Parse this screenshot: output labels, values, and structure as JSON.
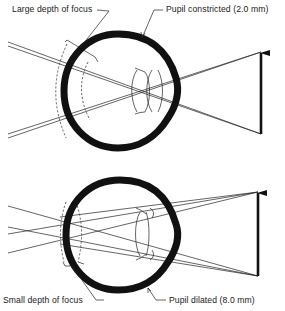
{
  "figure": {
    "top_panel": {
      "depth_label": "Large depth of focus",
      "pupil_label": "Pupil constricted (2.0 mm)",
      "pupil_size_mm": 2.0
    },
    "bottom_panel": {
      "depth_label": "Small depth of focus",
      "pupil_label": "Pupil dilated (8.0 mm)",
      "pupil_size_mm": 8.0
    },
    "colors": {
      "ink": "#111111",
      "background": "#ffffff"
    }
  }
}
